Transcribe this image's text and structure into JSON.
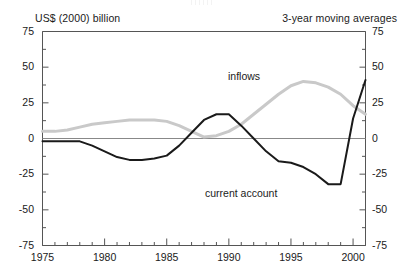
{
  "header": {
    "y_axis_caption": "US$ (2000) billion",
    "note": "3-year moving averages"
  },
  "labels": {
    "inflows": "inflows",
    "current_account": "current account"
  },
  "colors": {
    "inflows_line": "#c9c9c9",
    "current_account_line": "#1a1a1a",
    "axis": "#555555",
    "zero_line": "#888888",
    "background": "#ffffff"
  },
  "chart_data": {
    "type": "line",
    "title": "",
    "subtitle": "",
    "xlabel": "",
    "ylabel": "US$ (2000) billion",
    "annotation": "3-year moving averages",
    "grid": false,
    "legend_position": "inline-labels",
    "xlim": [
      1975,
      2001
    ],
    "ylim": [
      -75,
      75
    ],
    "yticks": [
      -75,
      -50,
      -25,
      0,
      25,
      50,
      75
    ],
    "ytick_labels": [
      "-75",
      "-50",
      "-25",
      "0",
      "25",
      "50",
      "75"
    ],
    "y_axis_dual": true,
    "xticks": [
      1975,
      1980,
      1985,
      1990,
      1995,
      2000
    ],
    "xtick_labels": [
      "1975",
      "1980",
      "1985",
      "1990",
      "1995",
      "2000"
    ],
    "x_minor_tick_interval": 1,
    "x": [
      1975,
      1976,
      1977,
      1978,
      1979,
      1980,
      1981,
      1982,
      1983,
      1984,
      1985,
      1986,
      1987,
      1988,
      1989,
      1990,
      1991,
      1992,
      1993,
      1994,
      1995,
      1996,
      1997,
      1998,
      1999,
      2000,
      2001
    ],
    "series": [
      {
        "name": "inflows",
        "color": "#c9c9c9",
        "values": [
          5,
          5,
          6,
          8,
          10,
          11,
          12,
          13,
          13,
          13,
          12,
          9,
          5,
          1,
          2,
          5,
          10,
          17,
          24,
          31,
          37,
          40,
          39,
          36,
          31,
          23,
          17
        ]
      },
      {
        "name": "current account",
        "color": "#1a1a1a",
        "values": [
          -2,
          -2,
          -2,
          -2,
          -5,
          -9,
          -13,
          -15,
          -15,
          -14,
          -12,
          -5,
          4,
          13,
          17,
          17,
          9,
          0,
          -9,
          -16,
          -17,
          -20,
          -25,
          -32,
          -32,
          14,
          41
        ]
      }
    ],
    "series_notes": "current account rises steeply 1998-1999 to a peak near 50 at 1999, then falls to about 25 at 2001; inflows peak near 40 around 1996"
  }
}
